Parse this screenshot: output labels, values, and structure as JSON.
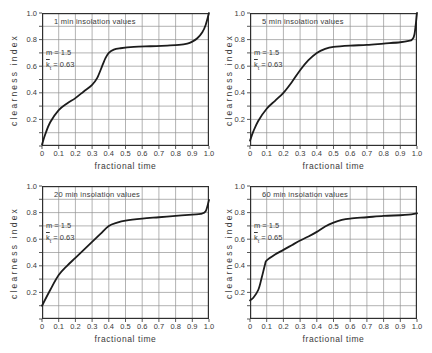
{
  "figure": {
    "background": "#ffffff",
    "ink": "#2f2f2f",
    "text_color": "#3a3a3a",
    "grid_color": "#929292",
    "curve_color": "#1c1c1c"
  },
  "axes": {
    "xlabel": "fractional time",
    "ylabel": "clearness index",
    "xlim": [
      0,
      1
    ],
    "ylim": [
      0,
      1
    ],
    "grid": "on",
    "grid_step": 0.1,
    "x_ticks": [
      {
        "v": 0,
        "label": "0"
      },
      {
        "v": 0.1,
        "label": "0.1"
      },
      {
        "v": 0.2,
        "label": "0.2"
      },
      {
        "v": 0.3,
        "label": "0.3"
      },
      {
        "v": 0.4,
        "label": "0.4"
      },
      {
        "v": 0.5,
        "label": "0.5"
      },
      {
        "v": 0.6,
        "label": "0.6"
      },
      {
        "v": 0.7,
        "label": "0.7"
      },
      {
        "v": 0.8,
        "label": "0.8"
      },
      {
        "v": 0.9,
        "label": "0.9"
      },
      {
        "v": 1,
        "label": "1.0"
      }
    ],
    "y_ticks": [
      {
        "v": 0.2,
        "label": "0.2"
      },
      {
        "v": 0.4,
        "label": "0.4"
      },
      {
        "v": 0.6,
        "label": "0.6"
      },
      {
        "v": 0.8,
        "label": "0.8"
      },
      {
        "v": 1,
        "label": "1.0"
      }
    ]
  },
  "chart_data": [
    {
      "type": "line",
      "title": "1 min insolation values",
      "annotation": {
        "m": "m = 1.5",
        "k_base": "k",
        "k_sub": "t",
        "k_value": " = 0.63"
      },
      "x": [
        0,
        0.02,
        0.05,
        0.1,
        0.15,
        0.2,
        0.25,
        0.3,
        0.33,
        0.36,
        0.38,
        0.4,
        0.43,
        0.47,
        0.55,
        0.65,
        0.75,
        0.82,
        0.87,
        0.9,
        0.93,
        0.96,
        0.98,
        1.0
      ],
      "y": [
        0.01,
        0.09,
        0.18,
        0.27,
        0.32,
        0.36,
        0.41,
        0.46,
        0.51,
        0.6,
        0.66,
        0.7,
        0.725,
        0.735,
        0.745,
        0.75,
        0.755,
        0.76,
        0.77,
        0.785,
        0.81,
        0.855,
        0.91,
        1.0
      ]
    },
    {
      "type": "line",
      "title": "5 min insolation values",
      "annotation": {
        "m": "m = 1.5",
        "k_base": "k",
        "k_sub": "t",
        "k_value": " = 0.63"
      },
      "x": [
        0,
        0.02,
        0.05,
        0.1,
        0.15,
        0.2,
        0.25,
        0.3,
        0.35,
        0.4,
        0.45,
        0.5,
        0.6,
        0.7,
        0.8,
        0.9,
        0.95,
        0.97,
        0.985,
        1.0
      ],
      "y": [
        0.04,
        0.11,
        0.19,
        0.28,
        0.34,
        0.4,
        0.48,
        0.57,
        0.645,
        0.7,
        0.73,
        0.745,
        0.755,
        0.76,
        0.77,
        0.78,
        0.79,
        0.8,
        0.84,
        1.0
      ]
    },
    {
      "type": "line",
      "title": "20 min insolation values",
      "annotation": {
        "m": "m = 1.5",
        "k_base": "k",
        "k_sub": "t",
        "k_value": " = 0.63"
      },
      "x": [
        0,
        0.05,
        0.1,
        0.15,
        0.2,
        0.25,
        0.3,
        0.35,
        0.4,
        0.45,
        0.5,
        0.6,
        0.7,
        0.8,
        0.9,
        0.95,
        0.98,
        1.0
      ],
      "y": [
        0.1,
        0.22,
        0.33,
        0.4,
        0.46,
        0.52,
        0.58,
        0.64,
        0.7,
        0.725,
        0.74,
        0.755,
        0.765,
        0.775,
        0.785,
        0.79,
        0.81,
        0.895
      ]
    },
    {
      "type": "line",
      "title": "60 min insolation values",
      "annotation": {
        "m": "m = 1.5",
        "k_base": "k",
        "k_sub": "t",
        "k_value": " = 0.65"
      },
      "x": [
        0,
        0.02,
        0.05,
        0.07,
        0.09,
        0.1,
        0.15,
        0.2,
        0.25,
        0.3,
        0.35,
        0.4,
        0.45,
        0.5,
        0.55,
        0.6,
        0.7,
        0.8,
        0.9,
        0.95,
        1.0
      ],
      "y": [
        0.14,
        0.16,
        0.22,
        0.31,
        0.41,
        0.44,
        0.485,
        0.52,
        0.555,
        0.59,
        0.62,
        0.655,
        0.695,
        0.725,
        0.745,
        0.755,
        0.765,
        0.775,
        0.78,
        0.785,
        0.795
      ]
    }
  ]
}
